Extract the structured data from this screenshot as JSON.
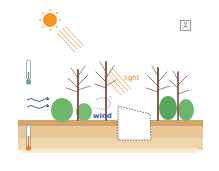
{
  "labels": {
    "light": "light",
    "wind": "wind"
  },
  "icons": {
    "sun": "sun-icon",
    "light_rays": "light-rays-icon",
    "air_thermometer": "air-thermometer-icon",
    "soil_thermometer": "soil-thermometer-icon",
    "wind_arrows": "wind-arrows-icon",
    "corner_badge": "person-badge-icon"
  },
  "colors": {
    "sun": "#f7931e",
    "rays": "#f3a060",
    "light_label": "#f0883a",
    "wind": "#3a5aa8",
    "soil": "#d9a96a",
    "soil_light": "#ecd3a8",
    "trunk": "#7a4a3a",
    "shrub": "#5fae62",
    "air_thermo": "#6fa58c",
    "soil_thermo": "#e8782a",
    "gap_outline": "#444444"
  }
}
